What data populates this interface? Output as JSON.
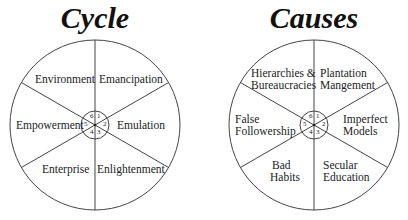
{
  "diagrams": [
    {
      "title": "Cycle",
      "segments": [
        {
          "number": "1",
          "label": "Emancipation"
        },
        {
          "number": "2",
          "label": "Emulation"
        },
        {
          "number": "3",
          "label": "Enlightenment"
        },
        {
          "number": "4",
          "label": "Enterprise"
        },
        {
          "number": "5",
          "label": "Empowerment"
        },
        {
          "number": "6",
          "label": "Environment"
        }
      ]
    },
    {
      "title": "Causes",
      "segments": [
        {
          "number": "1",
          "label_line1": "Plantation",
          "label_line2": "Mangement"
        },
        {
          "number": "2",
          "label_line1": "Imperfect",
          "label_line2": "Models"
        },
        {
          "number": "3",
          "label_line1": "Secular",
          "label_line2": "Education"
        },
        {
          "number": "4",
          "label_line1": "Bad",
          "label_line2": "Habits"
        },
        {
          "number": "5",
          "label_line1": "False",
          "label_line2": "Followership"
        },
        {
          "number": "6",
          "label_line1": "Hierarchies &",
          "label_line2": "Bureaucracies"
        }
      ]
    }
  ],
  "colors": {
    "line": "#444444",
    "text": "#222222",
    "background": "#ffffff"
  }
}
